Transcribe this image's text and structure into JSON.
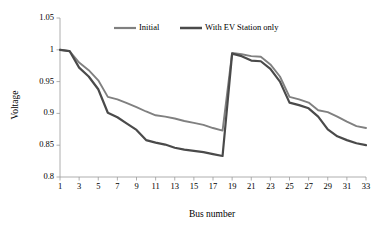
{
  "chart_data": {
    "type": "line",
    "title": "",
    "xlabel": "Bus number",
    "ylabel": "Voltage",
    "xlim": [
      1,
      33
    ],
    "ylim": [
      0.8,
      1.05
    ],
    "grid": false,
    "legend_position": "top-center",
    "ytick_labels": [
      "1.05",
      "1",
      "0.95",
      "0.9",
      "0.85",
      "0.8"
    ],
    "ytick_values": [
      1.05,
      1.0,
      0.95,
      0.9,
      0.85,
      0.8
    ],
    "xtick_labels": [
      "1",
      "3",
      "5",
      "7",
      "9",
      "11",
      "13",
      "15",
      "17",
      "19",
      "21",
      "23",
      "25",
      "27",
      "29",
      "31",
      "33"
    ],
    "xtick_values": [
      1,
      3,
      5,
      7,
      9,
      11,
      13,
      15,
      17,
      19,
      21,
      23,
      25,
      27,
      29,
      31,
      33
    ],
    "x": [
      1,
      2,
      3,
      4,
      5,
      6,
      7,
      8,
      9,
      10,
      11,
      12,
      13,
      14,
      15,
      16,
      17,
      18,
      19,
      20,
      21,
      22,
      23,
      24,
      25,
      26,
      27,
      28,
      29,
      30,
      31,
      32,
      33
    ],
    "series": [
      {
        "name": "Initial",
        "color": "#808080",
        "width": 1.9,
        "values": [
          1.0,
          0.998,
          0.98,
          0.968,
          0.952,
          0.926,
          0.922,
          0.916,
          0.91,
          0.903,
          0.897,
          0.895,
          0.892,
          0.888,
          0.885,
          0.882,
          0.877,
          0.873,
          0.995,
          0.993,
          0.99,
          0.989,
          0.977,
          0.958,
          0.926,
          0.922,
          0.917,
          0.905,
          0.902,
          0.895,
          0.887,
          0.88,
          0.877
        ]
      },
      {
        "name": "With EV Station only",
        "color": "#4a4a4a",
        "width": 2.2,
        "values": [
          1.0,
          0.998,
          0.972,
          0.958,
          0.938,
          0.901,
          0.894,
          0.884,
          0.874,
          0.858,
          0.854,
          0.851,
          0.846,
          0.843,
          0.841,
          0.839,
          0.836,
          0.833,
          0.994,
          0.99,
          0.983,
          0.982,
          0.97,
          0.95,
          0.917,
          0.913,
          0.908,
          0.895,
          0.875,
          0.864,
          0.858,
          0.853,
          0.85
        ]
      }
    ]
  },
  "legend": {
    "entries": [
      {
        "label": "Initial",
        "color": "#808080"
      },
      {
        "label": "With EV Station only",
        "color": "#4a4a4a"
      }
    ]
  }
}
